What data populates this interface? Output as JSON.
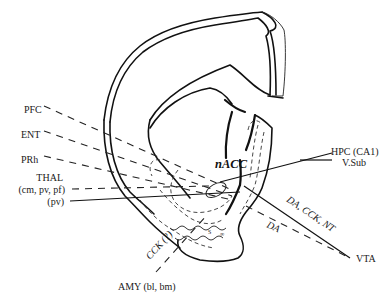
{
  "diagram": {
    "center_label": "nACC",
    "colors": {
      "ink": "#111111",
      "background": "#ffffff"
    },
    "inputs_left": [
      {
        "id": "pfc",
        "label": "PFC",
        "line": "dashed"
      },
      {
        "id": "ent",
        "label": "ENT",
        "line": "dashed"
      },
      {
        "id": "prh",
        "label": "PRh",
        "line": "dashed"
      },
      {
        "id": "thal",
        "label": "THAL",
        "line": "none"
      },
      {
        "id": "thal-cm",
        "label": "(cm, pv, pf)",
        "line": "dashed"
      },
      {
        "id": "thal-pv",
        "label": "(pv)",
        "line": "solid"
      }
    ],
    "inputs_right": [
      {
        "id": "hpc",
        "label": "HPC (CA1)",
        "line": "solid"
      },
      {
        "id": "vsub",
        "label": "V.Sub",
        "line": "solid"
      }
    ],
    "vta": {
      "label": "VTA",
      "solid_path_label": "DA, CCK, NT",
      "dashed_path_label": "DA"
    },
    "amygdala": {
      "label": "AMY (bl, bm)",
      "path_label": "CCK (?)"
    },
    "legend": {
      "solid_line": "solid projection",
      "dashed_line": "dashed projection"
    }
  }
}
